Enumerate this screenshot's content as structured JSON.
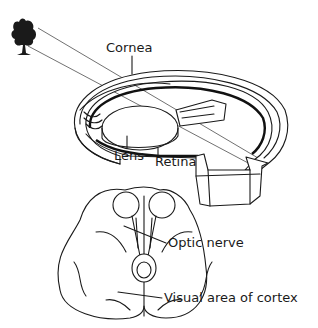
{
  "diagram": {
    "labels": {
      "cornea": "Cornea",
      "lens": "Lens",
      "retina": "Retina",
      "optic_nerve": "Optic nerve",
      "visual_cortex": "Visual area of cortex"
    },
    "elements": [
      "tree",
      "light-rays",
      "eyeball-cross-section",
      "brain-underside"
    ],
    "colors": {
      "line": "#1a1a1a",
      "background": "#ffffff"
    }
  }
}
